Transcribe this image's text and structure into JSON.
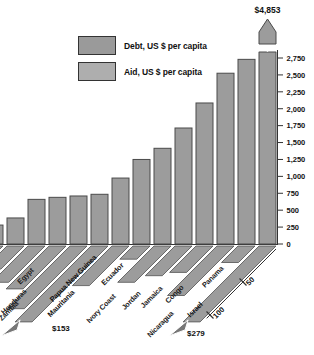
{
  "legend": {
    "items": [
      {
        "label": "Debt, US $ per capita",
        "color": "#9a9a9a"
      },
      {
        "label": "Aid, US $ per capita",
        "color": "#aeaeae"
      }
    ]
  },
  "colors": {
    "background": "#ffffff",
    "bar_fill": "#9c9c9c",
    "bar_stroke": "#4a4a4a",
    "ribbon_fill": "#9c9c9c",
    "ribbon_stroke": "#505050",
    "axis": "#333333",
    "text": "#111111"
  },
  "chart_data": {
    "type": "bar",
    "series": [
      {
        "name": "Debt, US $ per capita",
        "axis": "vertical"
      },
      {
        "name": "Aid, US $ per capita",
        "axis": "depth-diagonal"
      }
    ],
    "y_axis": {
      "min": 0,
      "max": 2750,
      "step": 250,
      "position": "right",
      "grid": false,
      "tick_labels": [
        "0",
        "250",
        "500",
        "750",
        "1,000",
        "1,250",
        "1,500",
        "1,750",
        "2,000",
        "2,250",
        "2,500",
        "2,750"
      ]
    },
    "depth_axis": {
      "tick_values": [
        50,
        100
      ],
      "tick_labels": [
        "50",
        "100"
      ]
    },
    "annotations": {
      "max_bar_label": "$4,853"
    },
    "countries": [
      {
        "name": "",
        "debt": 280,
        "aid": 40,
        "clipped": true
      },
      {
        "name": "Egypt",
        "debt": 385,
        "aid": 35,
        "label_xy": [
          34,
          271
        ]
      },
      {
        "name": "Honduras",
        "debt": 660,
        "aid": 55,
        "label_xy": [
          27,
          292
        ]
      },
      {
        "name": "Zambia",
        "debt": 690,
        "aid": 65,
        "label_xy": [
          19,
          304
        ]
      },
      {
        "name": "Papua New Guinea",
        "debt": 710,
        "aid": 95,
        "bold": true,
        "label_xy": [
          97,
          258
        ]
      },
      {
        "name": "Mauritania",
        "debt": 735,
        "aid": 153,
        "bold": true,
        "label_xy": [
          75,
          293
        ],
        "arrow_label": "$153",
        "arrow_label_xy": [
          52,
          331
        ]
      },
      {
        "name": "Ivory Coast",
        "debt": 975,
        "aid": 60,
        "label_xy": [
          116,
          297
        ]
      },
      {
        "name": "Ecuador",
        "debt": 1250,
        "aid": 20,
        "label_xy": [
          124,
          266
        ]
      },
      {
        "name": "Jordan",
        "debt": 1415,
        "aid": 55,
        "label_xy": [
          141,
          294
        ]
      },
      {
        "name": "Jamaica",
        "debt": 1715,
        "aid": 45,
        "label_xy": [
          163,
          289
        ]
      },
      {
        "name": "Congo",
        "debt": 2085,
        "aid": 40,
        "label_xy": [
          184,
          288
        ]
      },
      {
        "name": "Nicaragua",
        "debt": 2525,
        "aid": 75,
        "label_xy": [
          174,
          314
        ]
      },
      {
        "name": "Panama",
        "debt": 2730,
        "aid": 25,
        "label_xy": [
          224,
          269
        ]
      },
      {
        "name": "Israel",
        "debt": 4853,
        "aid": 279,
        "bold": true,
        "label_xy": [
          203,
          305
        ],
        "debt_label": "$4,853",
        "debt_exceeds_scale": true,
        "arrow_label": "$279",
        "arrow_label_xy": [
          187,
          336
        ]
      }
    ]
  }
}
